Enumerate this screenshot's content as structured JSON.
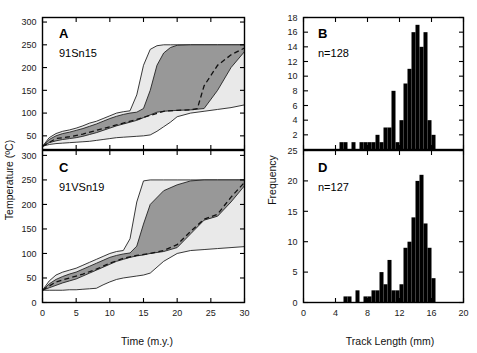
{
  "figure": {
    "background": "#ffffff",
    "colors": {
      "outer_envelope": "#e9e9e9",
      "inner_envelope": "#989898",
      "bar_fill": "#000000",
      "axis": "#000000"
    }
  },
  "axis_titles": {
    "temperature": "Temperature (ºC)",
    "time": "Time (m.y.)",
    "frequency": "Frequency",
    "track_length": "Track Length (mm)"
  },
  "panels": {
    "A": {
      "letter": "A",
      "sample": "91Sn15",
      "x_ticks": [
        0,
        5,
        10,
        15,
        20,
        25,
        30
      ],
      "x_tick_labels": [
        "",
        "",
        "",
        "",
        "",
        "",
        ""
      ],
      "y_ticks": [
        50,
        100,
        150,
        200,
        250,
        300
      ],
      "y_tick_labels": [
        "50",
        "100",
        "150",
        "200",
        "250",
        "300"
      ],
      "xlim": [
        0,
        30
      ],
      "ylim": [
        20,
        310
      ]
    },
    "B": {
      "letter": "B",
      "count_label": "n=128",
      "x_ticks": [
        0,
        4,
        8,
        12,
        16,
        20
      ],
      "x_tick_labels": [
        "",
        "",
        "",
        "",
        "",
        ""
      ],
      "y_ticks": [
        2,
        4,
        6,
        8,
        10,
        12,
        14,
        16,
        18
      ],
      "y_tick_labels": [
        "2",
        "4",
        "6",
        "8",
        "10",
        "12",
        "14",
        "16",
        "18"
      ],
      "xlim": [
        0,
        20
      ],
      "ylim": [
        0,
        18
      ]
    },
    "C": {
      "letter": "C",
      "sample": "91VSn19",
      "x_ticks": [
        0,
        5,
        10,
        15,
        20,
        25,
        30
      ],
      "x_tick_labels": [
        "0",
        "5",
        "10",
        "15",
        "20",
        "25",
        "30"
      ],
      "y_ticks": [
        0,
        50,
        100,
        150,
        200,
        250,
        300
      ],
      "y_tick_labels": [
        "0",
        "50",
        "100",
        "150",
        "200",
        "250",
        "300"
      ],
      "xlim": [
        0,
        30
      ],
      "ylim": [
        0,
        310
      ]
    },
    "D": {
      "letter": "D",
      "count_label": "n=127",
      "x_ticks": [
        0,
        4,
        8,
        12,
        16,
        20
      ],
      "x_tick_labels": [
        "0",
        "4",
        "8",
        "12",
        "16",
        "20"
      ],
      "y_ticks": [
        0,
        5,
        10,
        15,
        20,
        25
      ],
      "y_tick_labels": [
        "0",
        "5",
        "10",
        "15",
        "20",
        "25"
      ],
      "xlim": [
        0,
        20
      ],
      "ylim": [
        0,
        25
      ]
    }
  },
  "chart_data": [
    {
      "id": "panel-A",
      "type": "area",
      "title": "A  91Sn15",
      "xlabel": "Time (m.y.)",
      "ylabel": "Temperature (ºC)",
      "xlim": [
        0,
        30
      ],
      "ylim": [
        20,
        310
      ],
      "grid": false,
      "legend": "none",
      "series": [
        {
          "name": "outer envelope (90% confidence) upper bound",
          "x": [
            0,
            1,
            2,
            3,
            4,
            5,
            6,
            7,
            8,
            9,
            10,
            11,
            12,
            13,
            14,
            15,
            16,
            17,
            18,
            19,
            20,
            22,
            24,
            26,
            28,
            30
          ],
          "y": [
            27,
            46,
            55,
            60,
            63,
            67,
            72,
            78,
            82,
            88,
            94,
            100,
            103,
            105,
            140,
            205,
            240,
            248,
            250,
            250,
            250,
            250,
            250,
            250,
            250,
            250
          ]
        },
        {
          "name": "outer envelope (90% confidence) lower bound",
          "x": [
            0,
            1,
            2,
            3,
            4,
            5,
            6,
            7,
            8,
            9,
            10,
            11,
            12,
            13,
            14,
            15,
            16,
            17,
            18,
            19,
            20,
            22,
            24,
            26,
            28,
            30
          ],
          "y": [
            27,
            31,
            33,
            34,
            35,
            36,
            37,
            38,
            40,
            42,
            44,
            46,
            47,
            48,
            49,
            50,
            52,
            60,
            70,
            80,
            92,
            100,
            104,
            108,
            112,
            118
          ]
        },
        {
          "name": "inner envelope (68% confidence) upper bound",
          "x": [
            0,
            1,
            2,
            3,
            4,
            5,
            6,
            7,
            8,
            9,
            10,
            11,
            12,
            13,
            14,
            15,
            16,
            17,
            18,
            19,
            20,
            22,
            24,
            26,
            28,
            30
          ],
          "y": [
            27,
            42,
            50,
            55,
            58,
            62,
            66,
            71,
            76,
            82,
            88,
            93,
            97,
            100,
            102,
            110,
            150,
            205,
            232,
            244,
            249,
            250,
            250,
            250,
            250,
            250
          ]
        },
        {
          "name": "inner envelope (68% confidence) lower bound",
          "x": [
            0,
            1,
            2,
            3,
            4,
            5,
            6,
            7,
            8,
            9,
            10,
            11,
            12,
            13,
            14,
            15,
            16,
            17,
            18,
            19,
            20,
            22,
            24,
            26,
            28,
            30
          ],
          "y": [
            27,
            35,
            39,
            42,
            44,
            46,
            49,
            53,
            57,
            62,
            67,
            72,
            76,
            80,
            84,
            90,
            96,
            102,
            104,
            105,
            106,
            107,
            110,
            150,
            200,
            235
          ]
        },
        {
          "name": "best-fit thermal history",
          "style": "dashed",
          "x": [
            0,
            2,
            4,
            6,
            8,
            10,
            12,
            14,
            16,
            18,
            20,
            22,
            23,
            24,
            26,
            28,
            30
          ],
          "y": [
            27,
            44,
            48,
            54,
            62,
            70,
            78,
            86,
            95,
            104,
            106,
            107,
            110,
            160,
            205,
            228,
            243
          ]
        }
      ]
    },
    {
      "id": "panel-C",
      "type": "area",
      "title": "C  91VSn19",
      "xlabel": "Time (m.y.)",
      "ylabel": "Temperature (ºC)",
      "xlim": [
        0,
        30
      ],
      "ylim": [
        0,
        310
      ],
      "grid": false,
      "legend": "none",
      "series": [
        {
          "name": "outer envelope (90% confidence) upper bound",
          "x": [
            0,
            1,
            2,
            3,
            4,
            5,
            6,
            7,
            8,
            9,
            10,
            11,
            12,
            13,
            14,
            15,
            16,
            18,
            20,
            22,
            24,
            26,
            28,
            30
          ],
          "y": [
            25,
            44,
            56,
            62,
            66,
            70,
            76,
            82,
            88,
            94,
            100,
            104,
            106,
            130,
            205,
            248,
            250,
            250,
            250,
            250,
            250,
            250,
            250,
            250
          ]
        },
        {
          "name": "outer envelope (90% confidence) lower bound",
          "x": [
            0,
            1,
            2,
            3,
            4,
            5,
            6,
            7,
            8,
            9,
            10,
            11,
            12,
            13,
            14,
            15,
            16,
            18,
            20,
            22,
            24,
            26,
            28,
            30
          ],
          "y": [
            25,
            25,
            25,
            25,
            26,
            26,
            27,
            28,
            29,
            36,
            42,
            47,
            50,
            52,
            54,
            56,
            60,
            84,
            100,
            106,
            108,
            110,
            112,
            114
          ]
        },
        {
          "name": "inner envelope (68% confidence) upper bound",
          "x": [
            0,
            1,
            2,
            3,
            4,
            5,
            6,
            7,
            8,
            9,
            10,
            11,
            12,
            13,
            14,
            15,
            16,
            18,
            20,
            22,
            24,
            26,
            28,
            30
          ],
          "y": [
            25,
            38,
            47,
            53,
            58,
            62,
            68,
            74,
            80,
            86,
            92,
            96,
            99,
            101,
            115,
            160,
            200,
            228,
            240,
            248,
            250,
            250,
            250,
            250
          ]
        },
        {
          "name": "inner envelope (68% confidence) lower bound",
          "x": [
            0,
            1,
            2,
            3,
            4,
            5,
            6,
            7,
            8,
            9,
            10,
            11,
            12,
            13,
            14,
            15,
            16,
            18,
            20,
            22,
            24,
            26,
            28,
            30
          ],
          "y": [
            25,
            30,
            35,
            40,
            44,
            48,
            54,
            60,
            66,
            72,
            78,
            84,
            88,
            92,
            95,
            97,
            100,
            104,
            112,
            140,
            168,
            176,
            205,
            238
          ]
        },
        {
          "name": "best-fit thermal history",
          "style": "dashed",
          "x": [
            0,
            2,
            4,
            6,
            8,
            10,
            12,
            14,
            16,
            18,
            20,
            22,
            24,
            26,
            28,
            30
          ],
          "y": [
            25,
            42,
            50,
            58,
            68,
            80,
            90,
            96,
            100,
            106,
            118,
            145,
            170,
            180,
            215,
            245
          ]
        }
      ]
    },
    {
      "id": "panel-B",
      "type": "bar",
      "title": "B  n=128",
      "xlabel": "Track Length (mm)",
      "ylabel": "Frequency",
      "xlim": [
        0,
        20
      ],
      "ylim": [
        0,
        18
      ],
      "grid": false,
      "legend": "none",
      "bin_width": 0.5,
      "bin_starts": [
        4.5,
        5.0,
        5.5,
        6.0,
        6.5,
        7.0,
        7.5,
        8.0,
        8.5,
        9.0,
        9.5,
        10.0,
        10.5,
        11.0,
        11.5,
        12.0,
        12.5,
        13.0,
        13.5,
        14.0,
        14.5,
        15.0,
        15.5,
        16.0
      ],
      "categories": [
        "4.5",
        "5.0",
        "5.5",
        "6.0",
        "6.5",
        "7.0",
        "7.5",
        "8.0",
        "8.5",
        "9.0",
        "9.5",
        "10.0",
        "10.5",
        "11.0",
        "11.5",
        "12.0",
        "12.5",
        "13.0",
        "13.5",
        "14.0",
        "14.5",
        "15.0",
        "15.5",
        "16.0"
      ],
      "values": [
        1,
        1,
        0,
        1,
        0,
        1,
        1,
        1,
        1,
        2,
        1,
        3,
        3,
        8,
        1,
        4,
        9,
        11,
        16,
        17,
        14,
        16,
        4,
        2
      ]
    },
    {
      "id": "panel-D",
      "type": "bar",
      "title": "D  n=127",
      "xlabel": "Track Length (mm)",
      "ylabel": "Frequency",
      "xlim": [
        0,
        20
      ],
      "ylim": [
        0,
        25
      ],
      "grid": false,
      "legend": "none",
      "bin_width": 0.5,
      "bin_starts": [
        5.0,
        5.5,
        6.0,
        6.5,
        7.0,
        7.5,
        8.0,
        8.5,
        9.0,
        9.5,
        10.0,
        10.5,
        11.0,
        11.5,
        12.0,
        12.5,
        13.0,
        13.5,
        14.0,
        14.5,
        15.0,
        15.5,
        16.0,
        16.5
      ],
      "categories": [
        "5.0",
        "5.5",
        "6.0",
        "6.5",
        "7.0",
        "7.5",
        "8.0",
        "8.5",
        "9.0",
        "9.5",
        "10.0",
        "10.5",
        "11.0",
        "11.5",
        "12.0",
        "12.5",
        "13.0",
        "13.5",
        "14.0",
        "14.5",
        "15.0",
        "15.5",
        "16.0",
        "16.5"
      ],
      "values": [
        1,
        1,
        0,
        2,
        0,
        1,
        1,
        2,
        2,
        5,
        3,
        7,
        2,
        2,
        3,
        9,
        10,
        14,
        20,
        21,
        13,
        9,
        4,
        0
      ]
    }
  ]
}
